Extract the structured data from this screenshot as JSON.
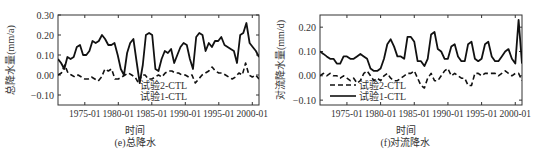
{
  "chart_data": [
    {
      "id": "e",
      "type": "line",
      "title": "(e)总降水",
      "xlabel": "时间",
      "ylabel": "总降水量(mm/a)",
      "ylim": [
        -0.15,
        0.3
      ],
      "yticks": [
        -0.1,
        0.0,
        0.1,
        0.2,
        0.3
      ],
      "ytick_labels": [
        "-0.10",
        "0.00",
        "0.10",
        "0.20",
        "0.30"
      ],
      "xlim": [
        1971.0,
        2001.0
      ],
      "xticks": [
        1975,
        1980,
        1985,
        1990,
        1995,
        2000
      ],
      "xtick_labels": [
        "1975-01",
        "1980-01",
        "1985-01",
        "1990-01",
        "1995-01",
        "2000-01"
      ],
      "grid": false,
      "legend": {
        "position": "lower-left",
        "show_line_samples": false
      },
      "series": [
        {
          "name": "试验2-CTL",
          "style": "dashed",
          "x": [
            1971.0,
            1971.5,
            1972.0,
            1972.5,
            1973.0,
            1973.5,
            1974.0,
            1974.5,
            1975.0,
            1975.5,
            1976.0,
            1976.5,
            1977.0,
            1977.5,
            1978.0,
            1978.5,
            1979.0,
            1979.5,
            1980.0,
            1980.5,
            1981.0,
            1981.5,
            1982.0,
            1982.5,
            1983.0,
            1983.5,
            1984.0,
            1984.5,
            1985.0,
            1985.5,
            1986.0,
            1986.5,
            1987.0,
            1987.5,
            1988.0,
            1988.5,
            1989.0,
            1989.5,
            1990.0,
            1990.5,
            1991.0,
            1991.5,
            1992.0,
            1992.5,
            1993.0,
            1993.5,
            1994.0,
            1994.5,
            1995.0,
            1995.5,
            1996.0,
            1996.5,
            1997.0,
            1997.5,
            1998.0,
            1998.5,
            1999.0,
            1999.5,
            2000.0,
            2000.5,
            2001.0
          ],
          "values": [
            0.0,
            0.01,
            0.05,
            0.01,
            0.0,
            -0.01,
            0.0,
            -0.01,
            -0.02,
            -0.02,
            -0.01,
            -0.02,
            -0.03,
            -0.01,
            0.03,
            0.02,
            0.03,
            -0.02,
            -0.02,
            -0.01,
            0.0,
            0.01,
            0.0,
            -0.01,
            -0.04,
            0.0,
            0.0,
            -0.02,
            -0.02,
            -0.01,
            0.0,
            -0.01,
            0.01,
            0.02,
            0.02,
            0.01,
            0.01,
            0.0,
            0.0,
            -0.01,
            0.0,
            -0.04,
            -0.02,
            0.0,
            0.01,
            0.02,
            0.04,
            0.02,
            0.01,
            0.01,
            0.0,
            -0.01,
            -0.02,
            -0.01,
            0.01,
            0.0,
            0.06,
            0.0,
            -0.01,
            0.0,
            -0.02
          ]
        },
        {
          "name": "试验1-CTL",
          "style": "solid",
          "x": [
            1971.0,
            1971.5,
            1972.0,
            1972.5,
            1973.0,
            1973.5,
            1974.0,
            1974.5,
            1975.0,
            1975.5,
            1976.0,
            1976.5,
            1977.0,
            1977.5,
            1978.0,
            1978.5,
            1979.0,
            1979.5,
            1980.0,
            1980.5,
            1981.0,
            1981.5,
            1982.0,
            1982.5,
            1983.0,
            1983.5,
            1984.0,
            1984.5,
            1985.0,
            1985.5,
            1986.0,
            1986.5,
            1987.0,
            1987.5,
            1988.0,
            1988.5,
            1989.0,
            1989.5,
            1990.0,
            1990.5,
            1991.0,
            1991.5,
            1992.0,
            1992.5,
            1993.0,
            1993.5,
            1994.0,
            1994.5,
            1995.0,
            1995.5,
            1996.0,
            1996.5,
            1997.0,
            1997.5,
            1998.0,
            1998.5,
            1999.0,
            1999.5,
            2000.0,
            2000.5,
            2001.0
          ],
          "values": [
            0.08,
            0.06,
            0.03,
            0.09,
            0.08,
            0.09,
            0.14,
            0.15,
            0.1,
            0.1,
            0.12,
            0.17,
            0.16,
            0.17,
            0.2,
            0.18,
            0.15,
            0.15,
            0.16,
            0.1,
            0.03,
            0.0,
            0.11,
            0.16,
            0.18,
            0.07,
            -0.04,
            0.05,
            0.2,
            0.21,
            0.2,
            0.03,
            0.02,
            0.08,
            0.12,
            0.11,
            0.13,
            0.06,
            0.1,
            0.14,
            0.16,
            0.15,
            0.08,
            0.03,
            0.19,
            0.21,
            0.2,
            0.12,
            0.16,
            0.14,
            0.17,
            0.17,
            0.19,
            0.15,
            0.14,
            0.13,
            0.12,
            0.06,
            0.2,
            0.21,
            0.26,
            0.16,
            0.14,
            0.12,
            0.09
          ],
          "note": "solid series sampled more finely near the end"
        }
      ]
    },
    {
      "id": "f",
      "type": "line",
      "title": "(f)对流降水",
      "xlabel": "时间",
      "ylabel": "对流降水量(mm/d)",
      "ylim": [
        -0.12,
        0.25
      ],
      "yticks": [
        -0.1,
        0.0,
        0.1,
        0.2
      ],
      "ytick_labels": [
        "-0.10",
        "0.00",
        "0.10",
        "0.20"
      ],
      "xlim": [
        1971.0,
        2001.0
      ],
      "xticks": [
        1975,
        1980,
        1985,
        1990,
        1995,
        2000
      ],
      "xtick_labels": [
        "1975-01",
        "1980-01",
        "1985-01",
        "1990-01",
        "1995-01",
        "2000-01"
      ],
      "grid": false,
      "legend": {
        "position": "lower-left",
        "show_line_samples": true
      },
      "series": [
        {
          "name": "试验2-CTL",
          "style": "dashed",
          "x": [
            1971.0,
            1971.5,
            1972.0,
            1972.5,
            1973.0,
            1973.5,
            1974.0,
            1974.5,
            1975.0,
            1975.5,
            1976.0,
            1976.5,
            1977.0,
            1977.5,
            1978.0,
            1978.5,
            1979.0,
            1979.5,
            1980.0,
            1980.5,
            1981.0,
            1981.5,
            1982.0,
            1982.5,
            1983.0,
            1983.5,
            1984.0,
            1984.5,
            1985.0,
            1985.5,
            1986.0,
            1986.5,
            1987.0,
            1987.5,
            1988.0,
            1988.5,
            1989.0,
            1989.5,
            1990.0,
            1990.5,
            1991.0,
            1991.5,
            1992.0,
            1992.5,
            1993.0,
            1993.5,
            1994.0,
            1994.5,
            1995.0,
            1995.5,
            1996.0,
            1996.5,
            1997.0,
            1997.5,
            1998.0,
            1998.5,
            1999.0,
            1999.5,
            2000.0,
            2000.5,
            2001.0
          ],
          "values": [
            0.0,
            0.01,
            0.0,
            0.01,
            0.0,
            0.0,
            -0.01,
            0.0,
            -0.01,
            -0.02,
            -0.01,
            -0.03,
            -0.02,
            0.01,
            0.02,
            0.0,
            -0.02,
            -0.01,
            -0.02,
            0.0,
            0.01,
            -0.01,
            -0.02,
            -0.02,
            -0.01,
            0.0,
            0.01,
            0.01,
            0.02,
            -0.01,
            -0.04,
            -0.05,
            -0.01,
            0.01,
            -0.02,
            -0.02,
            0.0,
            0.02,
            0.03,
            0.0,
            0.01,
            0.0,
            -0.01,
            -0.01,
            -0.04,
            -0.04,
            0.01,
            0.01,
            0.0,
            0.01,
            0.01,
            0.01,
            0.01,
            0.0,
            0.01,
            0.02,
            0.01,
            0.0,
            0.01,
            0.01,
            -0.02
          ]
        },
        {
          "name": "试验1-CTL",
          "style": "solid",
          "x": [
            1971.0,
            1971.5,
            1972.0,
            1972.5,
            1973.0,
            1973.5,
            1974.0,
            1974.5,
            1975.0,
            1975.5,
            1976.0,
            1976.5,
            1977.0,
            1977.5,
            1978.0,
            1978.5,
            1979.0,
            1979.5,
            1980.0,
            1980.5,
            1981.0,
            1981.5,
            1982.0,
            1982.5,
            1983.0,
            1983.5,
            1984.0,
            1984.5,
            1985.0,
            1985.5,
            1986.0,
            1986.5,
            1987.0,
            1987.5,
            1988.0,
            1988.5,
            1989.0,
            1989.5,
            1990.0,
            1990.5,
            1991.0,
            1991.5,
            1992.0,
            1992.5,
            1993.0,
            1993.5,
            1994.0,
            1994.5,
            1995.0,
            1995.5,
            1996.0,
            1996.5,
            1997.0,
            1997.5,
            1998.0,
            1998.5,
            1999.0,
            1999.5,
            2000.0,
            2000.5,
            2001.0
          ],
          "values": [
            0.1,
            0.09,
            0.08,
            0.07,
            0.07,
            0.05,
            0.05,
            0.08,
            0.08,
            0.07,
            0.07,
            0.08,
            0.09,
            0.08,
            0.07,
            0.03,
            0.02,
            0.02,
            0.03,
            0.07,
            0.13,
            0.15,
            0.12,
            0.08,
            0.08,
            0.07,
            0.16,
            0.16,
            0.14,
            0.06,
            0.06,
            0.04,
            0.07,
            0.17,
            0.18,
            0.11,
            0.1,
            0.07,
            0.07,
            0.12,
            0.13,
            0.08,
            0.06,
            0.06,
            0.13,
            0.14,
            0.07,
            0.06,
            0.07,
            0.13,
            0.14,
            0.08,
            0.06,
            0.06,
            0.08,
            0.1,
            0.11,
            0.07,
            0.05,
            0.23,
            0.05
          ]
        }
      ]
    }
  ],
  "panels": {
    "e": {
      "ylabel": "总降水量(mm/a)",
      "xlabel": "时间",
      "caption": "(e)总降水",
      "legend": [
        "试验2-CTL",
        "试验1-CTL"
      ]
    },
    "f": {
      "ylabel": "对流降水量(mm/d)",
      "xlabel": "时间",
      "caption": "(f)对流降水",
      "legend": [
        "试验2-CTL",
        "试验1-CTL"
      ]
    }
  },
  "colors": {
    "line": "#111111",
    "axis": "#333333",
    "text": "#333333",
    "background": "#ffffff"
  }
}
